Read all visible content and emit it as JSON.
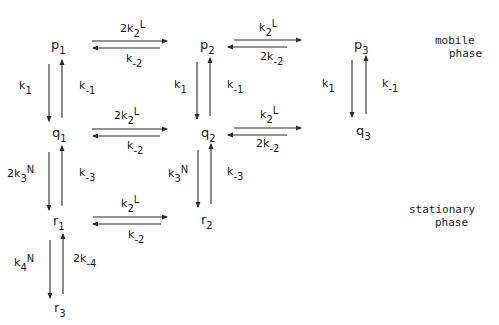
{
  "diagram": {
    "type": "reaction-scheme",
    "line_color": "#2a2a2a",
    "nodes": {
      "p1": {
        "base": "p",
        "sub": "1"
      },
      "p2": {
        "base": "p",
        "sub": "2"
      },
      "p3": {
        "base": "p",
        "sub": "3"
      },
      "q1": {
        "base": "q",
        "sub": "1"
      },
      "q2": {
        "base": "q",
        "sub": "2"
      },
      "q3": {
        "base": "q",
        "sub": "3"
      },
      "r1": {
        "base": "r",
        "sub": "1"
      },
      "r2": {
        "base": "r",
        "sub": "2"
      },
      "r3": {
        "base": "r",
        "sub": "3"
      }
    },
    "rates": {
      "p1_p2_fwd": {
        "pre": "2k",
        "sub": "2",
        "post": "L"
      },
      "p1_p2_rev": {
        "pre": "k",
        "sub": "-2",
        "post": ""
      },
      "p2_p3_fwd": {
        "pre": "k",
        "sub": "2",
        "post": "L"
      },
      "p2_p3_rev": {
        "pre": "2k",
        "sub": "-2",
        "post": ""
      },
      "q1_q2_fwd": {
        "pre": "2k",
        "sub": "2",
        "post": "L"
      },
      "q1_q2_rev": {
        "pre": "k",
        "sub": "-2",
        "post": ""
      },
      "q2_q3_fwd": {
        "pre": "k",
        "sub": "2",
        "post": "L"
      },
      "q2_q3_rev": {
        "pre": "2k",
        "sub": "-2",
        "post": ""
      },
      "r1_r2_fwd": {
        "pre": "k",
        "sub": "2",
        "post": "L"
      },
      "r1_r2_rev": {
        "pre": "k",
        "sub": "-2",
        "post": ""
      },
      "p1_q1_down": {
        "pre": "k",
        "sub": "1",
        "post": ""
      },
      "p1_q1_up": {
        "pre": "k",
        "sub": "-1",
        "post": ""
      },
      "p2_q2_down": {
        "pre": "k",
        "sub": "1",
        "post": ""
      },
      "p2_q2_up": {
        "pre": "k",
        "sub": "-1",
        "post": ""
      },
      "p3_q3_down": {
        "pre": "k",
        "sub": "1",
        "post": ""
      },
      "p3_q3_up": {
        "pre": "k",
        "sub": "-1",
        "post": ""
      },
      "q1_r1_down": {
        "pre": "2k",
        "sub": "3",
        "post": "N"
      },
      "q1_r1_up": {
        "pre": "k",
        "sub": "-3",
        "post": ""
      },
      "q2_r2_down": {
        "pre": "k",
        "sub": "3",
        "post": "N"
      },
      "q2_r2_up": {
        "pre": "k",
        "sub": "-3",
        "post": ""
      },
      "r1_r3_down": {
        "pre": "k",
        "sub": "4",
        "post": "N"
      },
      "r1_r3_up": {
        "pre": "2k",
        "sub": "-4",
        "post": ""
      }
    },
    "phases": {
      "mobile": {
        "line1": "mobile",
        "line2": "phase"
      },
      "stationary": {
        "line1": "stationary",
        "line2": "phase"
      }
    }
  }
}
